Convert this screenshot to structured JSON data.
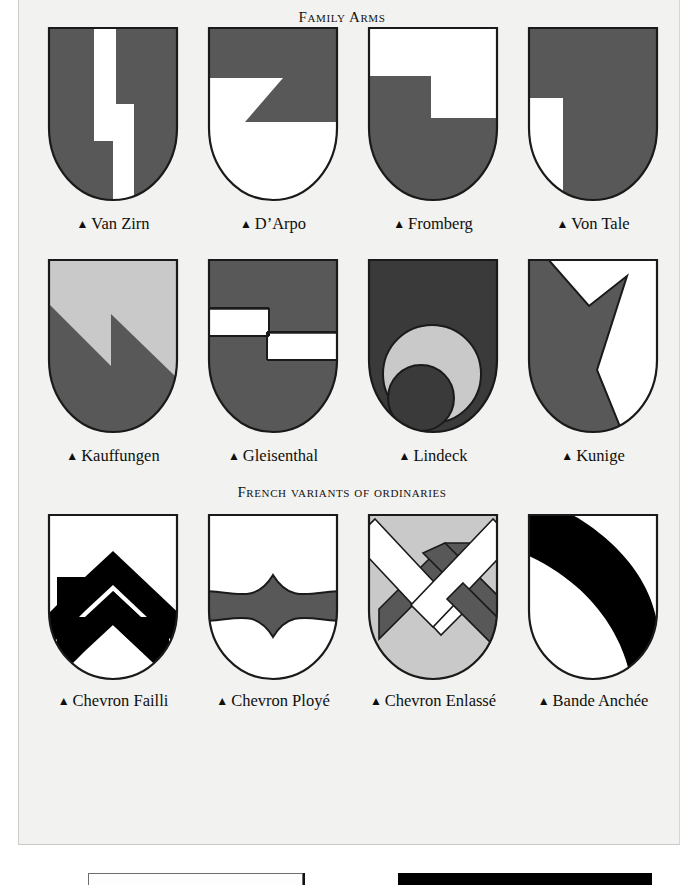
{
  "page": {
    "background_color": "#f2f2f0",
    "ink_color": "#15130f"
  },
  "palette": {
    "mid_gray": "#585858",
    "dark_gray": "#3a3a3a",
    "light_gray": "#c9c9c9",
    "white": "#ffffff",
    "black": "#000000",
    "outline": "#1a1a1a"
  },
  "sections": [
    {
      "id": "family-arms",
      "title": "Family Arms",
      "shields": [
        {
          "name": "Van Zirn",
          "caption": "Van Zirn",
          "bullet": "▲",
          "field": "#585858",
          "charge": "#ffffff",
          "description": "two offset white pallets"
        },
        {
          "name": "D'Arpo",
          "caption": "D’Arpo",
          "bullet": "▲",
          "field": "#ffffff",
          "charge": "#585858",
          "description": "gray chief with pointed wedge"
        },
        {
          "name": "Fromberg",
          "caption": "Fromberg",
          "bullet": "▲",
          "field": "#ffffff",
          "charge": "#585858",
          "description": "gray stepped base"
        },
        {
          "name": "Von Tale",
          "caption": "Von Tale",
          "bullet": "▲",
          "field": "#585858",
          "charge": "#ffffff",
          "description": "interlocking stepped partition"
        }
      ]
    },
    {
      "id": "family-arms-row2",
      "title": "",
      "shields": [
        {
          "name": "Kauffungen",
          "caption": "Kauffungen",
          "bullet": "▲",
          "field": "#c9c9c9",
          "charge": "#585858",
          "description": "zigzag party per bend"
        },
        {
          "name": "Gleisenthal",
          "caption": "Gleisenthal",
          "bullet": "▲",
          "field": "#585858",
          "charge": "#ffffff",
          "description": "two offset white fesses"
        },
        {
          "name": "Lindeck",
          "caption": "Lindeck",
          "bullet": "▲",
          "field": "#3a3a3a",
          "charge": "#c9c9c9",
          "description": "light crescent of two circles"
        },
        {
          "name": "Kunige",
          "caption": "Kunige",
          "bullet": "▲",
          "field": "#ffffff",
          "charge": "#585858",
          "description": "gray pile with V notch"
        }
      ]
    },
    {
      "id": "french-variants",
      "title": "French variants of ordinaries",
      "shields": [
        {
          "name": "Chevron Failli",
          "caption": "Chevron Failli",
          "bullet": "▲",
          "field": "#ffffff",
          "charge": "#000000",
          "description": "broken stepped chevrons"
        },
        {
          "name": "Chevron Ployé",
          "caption": "Chevron Ployé",
          "bullet": "▲",
          "field": "#ffffff",
          "charge": "#585858",
          "description": "bowed curved chevron"
        },
        {
          "name": "Chevron Enlassé",
          "caption": "Chevron Enlassé",
          "bullet": "▲",
          "field": "#c9c9c9",
          "charge": "#585858",
          "description": "interlaced white and gray bands"
        },
        {
          "name": "Bande Anchée",
          "caption": "Bande Anchée",
          "bullet": "▲",
          "field": "#ffffff",
          "charge": "#000000",
          "description": "black arched bend"
        }
      ]
    }
  ],
  "bottom_panels": [
    {
      "name": "left-panel-edge",
      "style": "outlined"
    },
    {
      "name": "right-panel-edge",
      "style": "solid-black"
    }
  ]
}
